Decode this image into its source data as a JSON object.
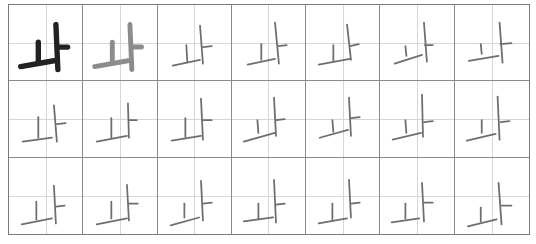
{
  "worksheet": {
    "character": "ㅘ",
    "rows": 3,
    "columns": 7,
    "colors": {
      "model": "#222222",
      "trace": "#8c8c8c",
      "pencil": "#6e6e6e",
      "cell_border": "#8a8a8a",
      "guide_line": "#d6d6d6"
    },
    "cells": [
      {
        "kind": "model",
        "strokes": [
          [
            30,
            38,
            30,
            58
          ],
          [
            12,
            63,
            46,
            57
          ],
          [
            48,
            20,
            50,
            66
          ],
          [
            50,
            43,
            60,
            43
          ]
        ]
      },
      {
        "kind": "trace",
        "strokes": [
          [
            30,
            38,
            30,
            58
          ],
          [
            12,
            63,
            46,
            57
          ],
          [
            48,
            20,
            50,
            66
          ],
          [
            50,
            43,
            60,
            43
          ]
        ]
      },
      {
        "kind": "pencil",
        "strokes": [
          [
            29,
            41,
            30,
            58
          ],
          [
            15,
            62,
            43,
            56
          ],
          [
            43,
            21,
            46,
            60
          ],
          [
            46,
            43,
            55,
            42
          ]
        ]
      },
      {
        "kind": "pencil",
        "strokes": [
          [
            30,
            40,
            30,
            56
          ],
          [
            16,
            61,
            44,
            55
          ],
          [
            44,
            18,
            48,
            60
          ],
          [
            47,
            42,
            56,
            41
          ]
        ]
      },
      {
        "kind": "pencil",
        "strokes": [
          [
            28,
            41,
            28,
            57
          ],
          [
            13,
            61,
            45,
            55
          ],
          [
            42,
            20,
            46,
            56
          ],
          [
            45,
            42,
            54,
            40
          ]
        ]
      },
      {
        "kind": "pencil",
        "strokes": [
          [
            26,
            42,
            27,
            52
          ],
          [
            15,
            60,
            43,
            51
          ],
          [
            45,
            18,
            48,
            58
          ],
          [
            46,
            41,
            54,
            41
          ]
        ]
      },
      {
        "kind": "pencil",
        "strokes": [
          [
            26,
            40,
            27,
            50
          ],
          [
            14,
            57,
            44,
            52
          ],
          [
            45,
            18,
            48,
            59
          ],
          [
            46,
            40,
            57,
            39
          ]
        ]
      },
      {
        "kind": "pencil",
        "strokes": [
          [
            30,
            37,
            30,
            58
          ],
          [
            14,
            62,
            44,
            58
          ],
          [
            46,
            25,
            49,
            62
          ],
          [
            49,
            44,
            58,
            43
          ]
        ]
      },
      {
        "kind": "pencil",
        "strokes": [
          [
            29,
            38,
            29,
            58
          ],
          [
            14,
            62,
            45,
            56
          ],
          [
            46,
            23,
            47,
            58
          ],
          [
            47,
            40,
            55,
            40
          ]
        ]
      },
      {
        "kind": "pencil",
        "strokes": [
          [
            28,
            38,
            28,
            57
          ],
          [
            14,
            61,
            44,
            56
          ],
          [
            44,
            18,
            46,
            60
          ],
          [
            46,
            40,
            55,
            40
          ]
        ]
      },
      {
        "kind": "pencil",
        "strokes": [
          [
            26,
            40,
            27,
            53
          ],
          [
            12,
            62,
            44,
            53
          ],
          [
            43,
            17,
            45,
            56
          ],
          [
            45,
            40,
            54,
            39
          ]
        ]
      },
      {
        "kind": "pencil",
        "strokes": [
          [
            27,
            40,
            28,
            52
          ],
          [
            14,
            58,
            43,
            50
          ],
          [
            44,
            17,
            46,
            56
          ],
          [
            46,
            38,
            55,
            37
          ]
        ]
      },
      {
        "kind": "pencil",
        "strokes": [
          [
            26,
            40,
            27,
            53
          ],
          [
            13,
            60,
            42,
            53
          ],
          [
            43,
            14,
            44,
            57
          ],
          [
            45,
            42,
            54,
            41
          ]
        ]
      },
      {
        "kind": "pencil",
        "strokes": [
          [
            27,
            40,
            27,
            53
          ],
          [
            12,
            61,
            41,
            54
          ],
          [
            43,
            16,
            45,
            60
          ],
          [
            46,
            42,
            55,
            41
          ]
        ]
      },
      {
        "kind": "pencil",
        "strokes": [
          [
            28,
            44,
            28,
            62
          ],
          [
            13,
            67,
            44,
            61
          ],
          [
            46,
            28,
            48,
            66
          ],
          [
            48,
            49,
            57,
            48
          ]
        ]
      },
      {
        "kind": "pencil",
        "strokes": [
          [
            29,
            44,
            29,
            61
          ],
          [
            14,
            67,
            45,
            61
          ],
          [
            45,
            27,
            47,
            63
          ],
          [
            47,
            46,
            56,
            46
          ]
        ]
      },
      {
        "kind": "pencil",
        "strokes": [
          [
            27,
            46,
            27,
            60
          ],
          [
            13,
            68,
            42,
            60
          ],
          [
            44,
            23,
            46,
            63
          ],
          [
            46,
            46,
            55,
            45
          ]
        ]
      },
      {
        "kind": "pencil",
        "strokes": [
          [
            27,
            46,
            27,
            61
          ],
          [
            12,
            64,
            42,
            60
          ],
          [
            43,
            22,
            45,
            65
          ],
          [
            45,
            47,
            54,
            46
          ]
        ]
      },
      {
        "kind": "pencil",
        "strokes": [
          [
            27,
            46,
            27,
            63
          ],
          [
            13,
            66,
            42,
            61
          ],
          [
            44,
            22,
            46,
            60
          ],
          [
            46,
            46,
            55,
            45
          ]
        ]
      },
      {
        "kind": "pencil",
        "strokes": [
          [
            26,
            46,
            26,
            61
          ],
          [
            12,
            65,
            40,
            61
          ],
          [
            43,
            25,
            45,
            64
          ],
          [
            45,
            45,
            54,
            45
          ]
        ]
      },
      {
        "kind": "pencil",
        "strokes": [
          [
            26,
            50,
            26,
            64
          ],
          [
            13,
            69,
            42,
            62
          ],
          [
            44,
            25,
            47,
            67
          ],
          [
            47,
            48,
            57,
            48
          ]
        ]
      }
    ]
  }
}
